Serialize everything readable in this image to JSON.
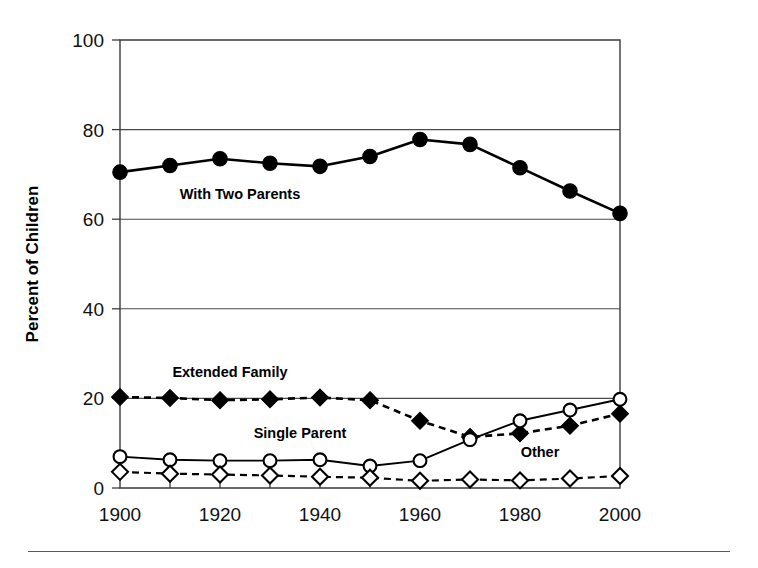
{
  "chart_data": {
    "type": "line",
    "title": "",
    "xlabel": "",
    "ylabel": "Percent of Children",
    "xlim": [
      1900,
      2000
    ],
    "ylim": [
      0,
      100
    ],
    "grid": "horizontal",
    "legend_position": "inline-annotations",
    "x": [
      1900,
      1910,
      1920,
      1930,
      1940,
      1950,
      1960,
      1970,
      1980,
      1990,
      2000
    ],
    "x_tick_labels": [
      "1900",
      "1920",
      "1940",
      "1960",
      "1980",
      "2000"
    ],
    "x_tick_values": [
      1900,
      1920,
      1940,
      1960,
      1980,
      2000
    ],
    "x_minor_ticks": [
      1910,
      1930,
      1950,
      1970,
      1990
    ],
    "y_tick_labels": [
      "0",
      "20",
      "40",
      "60",
      "80",
      "100"
    ],
    "y_tick_values": [
      0,
      20,
      40,
      60,
      80,
      100
    ],
    "series": [
      {
        "name": "With Two Parents",
        "label": "With Two Parents",
        "marker": "filled-circle",
        "line_style": "solid",
        "line_width": "thick",
        "label_x": 1924,
        "label_y": 64.5,
        "values": [
          70.5,
          72.0,
          73.5,
          72.5,
          71.8,
          74.0,
          77.8,
          76.7,
          71.5,
          66.3,
          61.3
        ]
      },
      {
        "name": "Extended Family",
        "label": "Extended Family",
        "marker": "filled-diamond",
        "line_style": "dashed",
        "line_width": "thick",
        "label_x": 1922,
        "label_y": 24.8,
        "values": [
          20.3,
          20.1,
          19.6,
          19.8,
          20.2,
          19.6,
          15.0,
          11.4,
          12.2,
          13.9,
          16.6
        ]
      },
      {
        "name": "Single Parent",
        "label": "Single Parent",
        "marker": "open-circle",
        "line_style": "solid",
        "line_width": "thin",
        "label_x": 1936,
        "label_y": 11.2,
        "values": [
          7.0,
          6.3,
          6.1,
          6.1,
          6.3,
          4.9,
          6.1,
          10.8,
          15.0,
          17.4,
          19.8
        ]
      },
      {
        "name": "Other",
        "label": "Other",
        "marker": "open-diamond",
        "line_style": "dashed",
        "line_width": "thin",
        "label_x": 1984,
        "label_y": 7.0,
        "values": [
          3.6,
          3.2,
          3.0,
          2.8,
          2.5,
          2.3,
          1.6,
          1.9,
          1.7,
          2.1,
          2.7
        ]
      }
    ]
  },
  "figure": {
    "axis_color": "#3a3a3a",
    "ink_color": "#000000",
    "background": "#ffffff",
    "rule_color": "#5a5a5a"
  }
}
